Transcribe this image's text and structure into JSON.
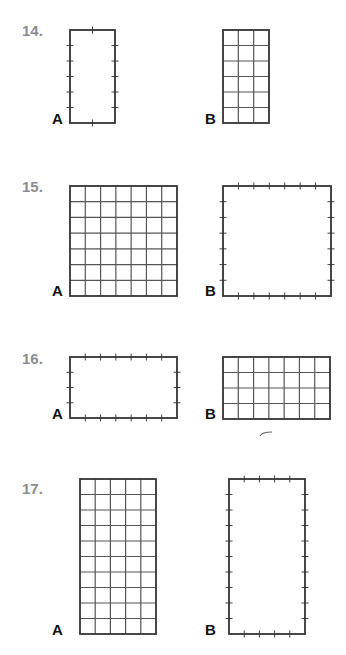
{
  "colors": {
    "outline": "#333333",
    "gridline": "#555555",
    "tick": "#444444",
    "problem_number": "#8c8c8c",
    "label": "#111111"
  },
  "problems": [
    {
      "number": "14.",
      "num_pos": [
        22,
        22
      ],
      "figures": [
        {
          "label": "A",
          "label_pos": [
            52,
            110
          ],
          "type": "ticks",
          "x": 70,
          "y": 30,
          "w": 45,
          "h": 93,
          "cols": 2,
          "rows": 6
        },
        {
          "label": "B",
          "label_pos": [
            205,
            110
          ],
          "type": "grid",
          "x": 223,
          "y": 30,
          "w": 46,
          "h": 93,
          "cols": 3,
          "rows": 6
        }
      ]
    },
    {
      "number": "15.",
      "num_pos": [
        22,
        178
      ],
      "figures": [
        {
          "label": "A",
          "label_pos": [
            52,
            282
          ],
          "type": "grid",
          "x": 70,
          "y": 186,
          "w": 107,
          "h": 110,
          "cols": 7,
          "rows": 7
        },
        {
          "label": "B",
          "label_pos": [
            205,
            282
          ],
          "type": "ticks",
          "x": 223,
          "y": 186,
          "w": 108,
          "h": 110,
          "cols": 7,
          "rows": 7
        }
      ]
    },
    {
      "number": "16.",
      "num_pos": [
        22,
        350
      ],
      "figures": [
        {
          "label": "A",
          "label_pos": [
            52,
            405
          ],
          "type": "ticks",
          "x": 70,
          "y": 357,
          "w": 107,
          "h": 61,
          "cols": 7,
          "rows": 4
        },
        {
          "label": "B",
          "label_pos": [
            205,
            405
          ],
          "type": "grid",
          "x": 223,
          "y": 357,
          "w": 107,
          "h": 62,
          "cols": 7,
          "rows": 4
        }
      ]
    },
    {
      "number": "17.",
      "num_pos": [
        22,
        480
      ],
      "figures": [
        {
          "label": "A",
          "label_pos": [
            52,
            621
          ],
          "type": "grid",
          "x": 80,
          "y": 479,
          "w": 76,
          "h": 155,
          "cols": 5,
          "rows": 10
        },
        {
          "label": "B",
          "label_pos": [
            205,
            621
          ],
          "type": "ticks",
          "x": 229,
          "y": 479,
          "w": 76,
          "h": 155,
          "cols": 5,
          "rows": 10
        }
      ]
    }
  ],
  "stray_mark": {
    "x1": 260,
    "y1": 436,
    "x2": 272,
    "y2": 432
  }
}
